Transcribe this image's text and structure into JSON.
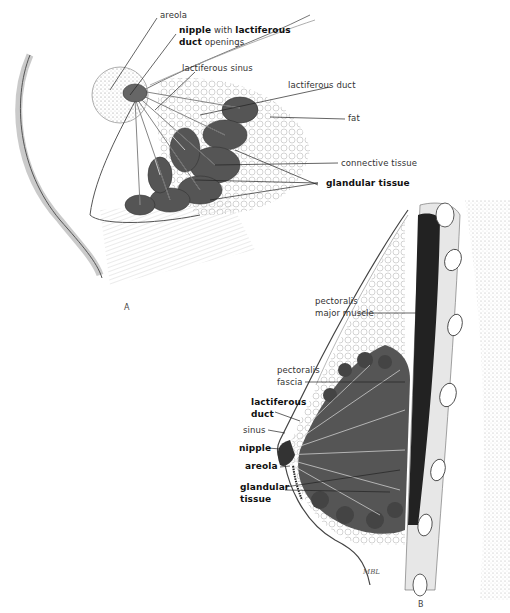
{
  "figure_a": {
    "panel_label": "A",
    "labels": {
      "areola": "areola",
      "nipple_bold": "nipple",
      "nipple_with": " with ",
      "lactiferous_bold": "lactiferous",
      "duct_bold": "duct",
      "openings": " openings",
      "lactiferous_sinus": "lactiferous sinus",
      "lactiferous_duct": "lactiferous duct",
      "fat": "fat",
      "connective_tissue": "connective tissue",
      "glandular_tissue": "glandular tissue"
    }
  },
  "figure_b": {
    "panel_label": "B",
    "labels": {
      "pectoralis_major_1": "pectoralis",
      "pectoralis_major_2": "major muscle",
      "pectoralis_fascia_1": "pectoralis",
      "pectoralis_fascia_2": "fascia",
      "lactiferous_duct_1": "lactiferous",
      "lactiferous_duct_2": "duct",
      "sinus": "sinus",
      "nipple": "nipple",
      "areola": "areola",
      "glandular_tissue_1": "glandular",
      "glandular_tissue_2": "tissue"
    },
    "signature": "MBL"
  }
}
